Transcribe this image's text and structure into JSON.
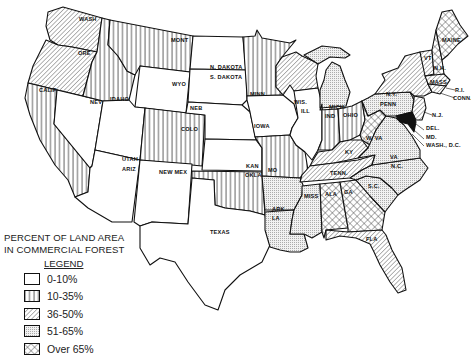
{
  "legend": {
    "title_line1": "PERCENT OF LAND AREA",
    "title_line2": "IN COMMERCIAL FOREST",
    "heading": "LEGEND",
    "items": [
      {
        "label": "0-10%",
        "pattern": "blank"
      },
      {
        "label": "10-35%",
        "pattern": "vertical-lines"
      },
      {
        "label": "36-50%",
        "pattern": "diagonal-lines"
      },
      {
        "label": "51-65%",
        "pattern": "dots"
      },
      {
        "label": "Over 65%",
        "pattern": "crosshatch"
      }
    ]
  },
  "states": {
    "wash": "WASH",
    "ore": "ORE",
    "calif": "CALIF",
    "nev": "NEV",
    "idaho": "IDAHO",
    "mont": "MONT",
    "wyo": "WYO",
    "utah": "UTAH",
    "ariz": "ARIZ",
    "colo": "COLO",
    "newmex": "NEW MEX",
    "ndak": "N. DAKOTA",
    "sdak": "S. DAKOTA",
    "neb": "NEB",
    "kan": "KAN",
    "okla": "OKLA",
    "texas": "TEXAS",
    "minn": "MINN",
    "iowa": "IOWA",
    "mo": "MO",
    "ark": "ARK",
    "la": "LA",
    "wis": "WIS.",
    "ill": "ILL",
    "mich": "MICH.",
    "ind": "IND",
    "ohio": "OHIO",
    "ky": "KY",
    "tenn": "TENN.",
    "miss": "MISS",
    "ala": "ALA",
    "ga": "GA",
    "fla": "FLA",
    "sc": "S.C.",
    "nc": "N.C.",
    "va": "VA",
    "wva": "W. VA",
    "penn": "PENN",
    "ny": "N.Y.",
    "vt": "VT",
    "nh": "N.H.",
    "maine": "MAINE",
    "mass": "MASS",
    "ri": "R.I.",
    "conn": "CONN.",
    "nj": "N.J.",
    "del": "DEL.",
    "md": "MD.",
    "dc": "WASH., D.C."
  }
}
